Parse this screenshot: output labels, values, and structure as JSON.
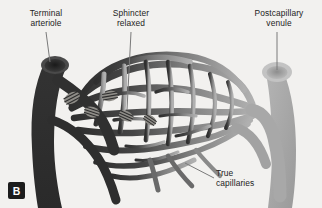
{
  "figure": {
    "panel_label": "B",
    "background_color": "#f2f1ef"
  },
  "labels": {
    "terminal_arteriole": "Terminal\narteriole",
    "sphincter_relaxed": "Sphincter\nrelaxed",
    "postcapillary_venule": "Postcapillary\nvenule",
    "true_capillaries": "True\ncapillaries"
  },
  "colors": {
    "arteriole_dark": "#3a3a3a",
    "arteriole_darkest": "#2b2b2b",
    "venule_light": "#a9a9a9",
    "mesh_mid": "#6e6e6e",
    "leader_line": "#7a7a7a",
    "text": "#232323",
    "badge_bg": "#1c1c1c",
    "badge_text": "#ffffff"
  },
  "icons": {
    "panel_badge": "panel-b-badge",
    "leader": "leader-line"
  }
}
